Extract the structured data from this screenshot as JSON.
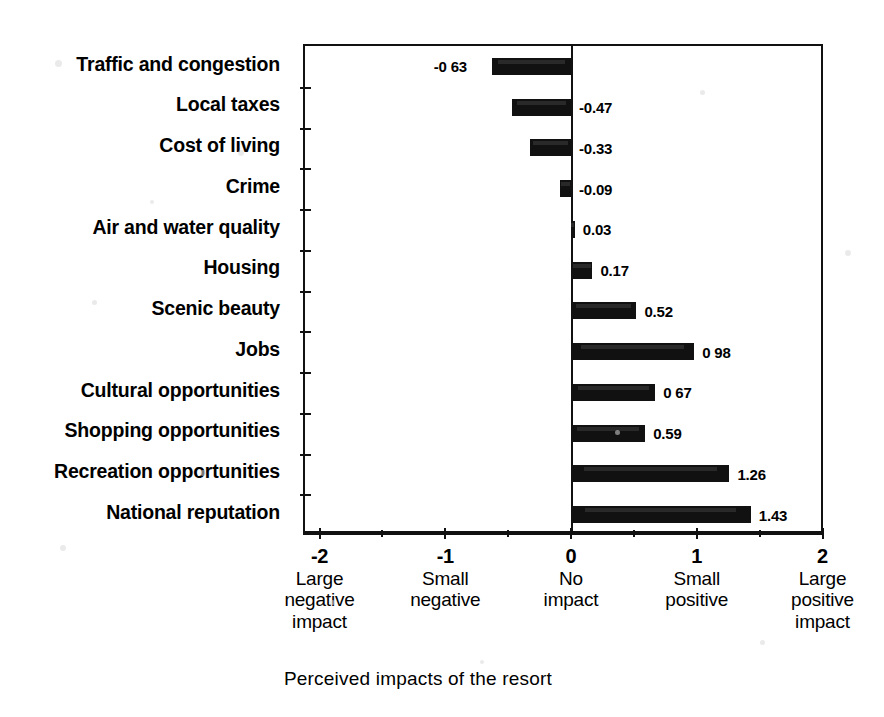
{
  "chart_data": {
    "type": "bar",
    "orientation": "horizontal",
    "title": "",
    "xlabel": "Perceived impacts of the resort",
    "ylabel": "",
    "xlim": [
      -2,
      2
    ],
    "grid": false,
    "legend": "none",
    "bar_color": "#111111",
    "categories": [
      "Traffic and congestion",
      "Local taxes",
      "Cost of living",
      "Crime",
      "Air and water quality",
      "Housing",
      "Scenic beauty",
      "Jobs",
      "Cultural opportunities",
      "Shopping opportunities",
      "Recreation opportunities",
      "National reputation"
    ],
    "values": [
      -0.63,
      -0.47,
      -0.33,
      -0.09,
      0.03,
      0.17,
      0.52,
      0.98,
      0.67,
      0.59,
      1.26,
      1.43
    ],
    "value_labels": [
      "-0 63",
      "-0.47",
      "-0.33",
      "-0.09",
      "0.03",
      "0.17",
      "0.52",
      "0 98",
      "0 67",
      "0.59",
      "1.26",
      "1.43"
    ],
    "value_label_side": [
      "left",
      "right",
      "right",
      "right",
      "right",
      "right",
      "right",
      "right",
      "right",
      "right",
      "right",
      "right"
    ],
    "xticks": [
      -2,
      -1,
      0,
      1,
      2
    ],
    "xtick_labels": [
      "-2",
      "-1",
      "0",
      "1",
      "2"
    ],
    "xtick_descriptions": [
      [
        "Large",
        "negative",
        "impact"
      ],
      [
        "Small",
        "negative"
      ],
      [
        "No",
        "impact"
      ],
      [
        "Small",
        "positive"
      ],
      [
        "Large",
        "positive",
        "impact"
      ]
    ],
    "xminor_ticks": [
      -1.5,
      -0.5,
      0.5,
      1.5
    ]
  },
  "axis": {
    "title": "Perceived impacts of the resort"
  }
}
